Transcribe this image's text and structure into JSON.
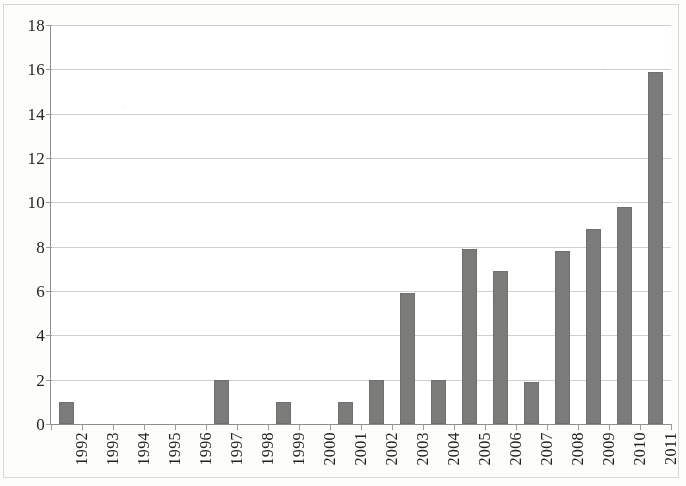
{
  "chart_data": {
    "type": "bar",
    "title": "",
    "subtitle": "",
    "xlabel": "",
    "ylabel": "",
    "categories": [
      "1992",
      "1993",
      "1994",
      "1995",
      "1996",
      "1997",
      "1998",
      "1999",
      "2000",
      "2001",
      "2002",
      "2003",
      "2004",
      "2005",
      "2006",
      "2007",
      "2008",
      "2009",
      "2010",
      "2011"
    ],
    "values": [
      1,
      0,
      0,
      0,
      0,
      2,
      0,
      1,
      0,
      1,
      2,
      5.9,
      2,
      7.9,
      6.9,
      1.9,
      7.8,
      8.8,
      9.8,
      15.9
    ],
    "series": [
      {
        "name": "",
        "values": [
          1,
          0,
          0,
          0,
          0,
          2,
          0,
          1,
          0,
          1,
          2,
          5.9,
          2,
          7.9,
          6.9,
          1.9,
          7.8,
          8.8,
          9.8,
          15.9
        ]
      }
    ],
    "ylim": [
      0,
      18
    ],
    "xlim_categories": 20,
    "y_ticks": [
      0,
      2,
      4,
      6,
      8,
      10,
      12,
      14,
      16,
      18
    ],
    "y_tick_labels": [
      "0",
      "2",
      "4",
      "6",
      "8",
      "10",
      "12",
      "14",
      "16",
      "18"
    ],
    "grid": true,
    "grid_axis": "y",
    "legend": false,
    "legend_position": "none",
    "annotations": [],
    "bar_color": "#7b7b79",
    "gridline_color": "#cfcfcb",
    "axis_color": "#8e8e8a",
    "background_color": "#ffffff",
    "x_tick_label_rotation": 90
  },
  "axes": {
    "y_tick_labels": [
      "18",
      "16",
      "14",
      "12",
      "10",
      "8",
      "6",
      "4",
      "2",
      "0"
    ],
    "x_tick_labels": [
      "1992",
      "1993",
      "1994",
      "1995",
      "1996",
      "1997",
      "1998",
      "1999",
      "2000",
      "2001",
      "2002",
      "2003",
      "2004",
      "2005",
      "2006",
      "2007",
      "2008",
      "2009",
      "2010",
      "2011"
    ]
  }
}
